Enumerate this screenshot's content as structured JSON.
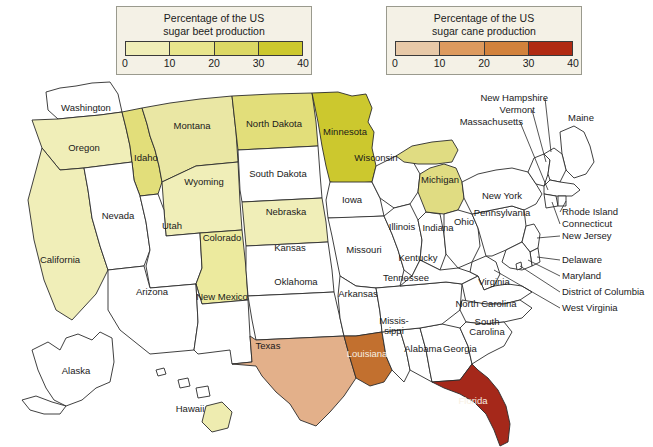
{
  "legends": [
    {
      "id": "beet",
      "title_line1": "Percentage of the US",
      "title_line2": "sugar beet production",
      "ticks": [
        "0",
        "10",
        "20",
        "30",
        "40"
      ],
      "colors": [
        "#f0eeb8",
        "#e8e58c",
        "#dcd865",
        "#ccc82e"
      ]
    },
    {
      "id": "cane",
      "title_line1": "Percentage of the US",
      "title_line2": "sugar cane production",
      "ticks": [
        "0",
        "10",
        "20",
        "30",
        "40"
      ],
      "colors": [
        "#e7c9a8",
        "#dd9a5e",
        "#d2823c",
        "#b02a12"
      ]
    }
  ],
  "map": {
    "background": "#ffffff",
    "unshaded_color": "#ffffff",
    "border_color": "#2b2b2b",
    "states": [
      {
        "name": "Washington",
        "label": "Washington",
        "fill": "#ffffff",
        "crop": "none",
        "bucket": null
      },
      {
        "name": "Oregon",
        "label": "Oregon",
        "fill": "#f0eeb8",
        "crop": "beet",
        "bucket": "0-10"
      },
      {
        "name": "Idaho",
        "label": "Idaho",
        "fill": "#e2de7a",
        "crop": "beet",
        "bucket": "20-30"
      },
      {
        "name": "Montana",
        "label": "Montana",
        "fill": "#eae7a4",
        "crop": "beet",
        "bucket": "10-20"
      },
      {
        "name": "North Dakota",
        "label": "North Dakota",
        "fill": "#e2de7a",
        "crop": "beet",
        "bucket": "20-30"
      },
      {
        "name": "Minnesota",
        "label": "Minnesota",
        "fill": "#ccc82e",
        "crop": "beet",
        "bucket": "30-40"
      },
      {
        "name": "South Dakota",
        "label": "South Dakota",
        "fill": "#ffffff",
        "crop": "none",
        "bucket": null
      },
      {
        "name": "Wisconsin",
        "label": "Wisconsin",
        "fill": "#ffffff",
        "crop": "none",
        "bucket": null
      },
      {
        "name": "Michigan",
        "label": "Michigan",
        "fill": "#e0dc82",
        "crop": "beet",
        "bucket": "10-20"
      },
      {
        "name": "Wyoming",
        "label": "Wyoming",
        "fill": "#f0eeb8",
        "crop": "beet",
        "bucket": "0-10"
      },
      {
        "name": "Nebraska",
        "label": "Nebraska",
        "fill": "#f0eeb8",
        "crop": "beet",
        "bucket": "0-10"
      },
      {
        "name": "Iowa",
        "label": "Iowa",
        "fill": "#ffffff",
        "crop": "none",
        "bucket": null
      },
      {
        "name": "Illinois",
        "label": "Illinois",
        "fill": "#ffffff",
        "crop": "none",
        "bucket": null
      },
      {
        "name": "Indiana",
        "label": "Indiana",
        "fill": "#ffffff",
        "crop": "none",
        "bucket": null
      },
      {
        "name": "Ohio",
        "label": "Ohio",
        "fill": "#ffffff",
        "crop": "none",
        "bucket": null
      },
      {
        "name": "Nevada",
        "label": "Nevada",
        "fill": "#ffffff",
        "crop": "none",
        "bucket": null
      },
      {
        "name": "Utah",
        "label": "Utah",
        "fill": "#ffffff",
        "crop": "none",
        "bucket": null
      },
      {
        "name": "Colorado",
        "label": "Colorado",
        "fill": "#ecea9e",
        "crop": "beet",
        "bucket": "10-20"
      },
      {
        "name": "California",
        "label": "California",
        "fill": "#f0eeb8",
        "crop": "beet",
        "bucket": "0-10"
      },
      {
        "name": "Arizona",
        "label": "Arizona",
        "fill": "#ffffff",
        "crop": "none",
        "bucket": null
      },
      {
        "name": "New Mexico",
        "label": "New Mexico",
        "fill": "#ffffff",
        "crop": "none",
        "bucket": null
      },
      {
        "name": "Kansas",
        "label": "Kansas",
        "fill": "#ffffff",
        "crop": "none",
        "bucket": null
      },
      {
        "name": "Missouri",
        "label": "Missouri",
        "fill": "#ffffff",
        "crop": "none",
        "bucket": null
      },
      {
        "name": "Oklahoma",
        "label": "Oklahoma",
        "fill": "#ffffff",
        "crop": "none",
        "bucket": null
      },
      {
        "name": "Arkansas",
        "label": "Arkansas",
        "fill": "#ffffff",
        "crop": "none",
        "bucket": null
      },
      {
        "name": "Texas",
        "label": "Texas",
        "fill": "#e3b08a",
        "crop": "cane",
        "bucket": "10-20"
      },
      {
        "name": "Louisiana",
        "label": "Louisiana",
        "fill": "#c2702f",
        "crop": "cane",
        "bucket": "20-30"
      },
      {
        "name": "Mississippi",
        "label": "Missis-sippi",
        "fill": "#ffffff",
        "crop": "none",
        "bucket": null
      },
      {
        "name": "Alabama",
        "label": "Alabama",
        "fill": "#ffffff",
        "crop": "none",
        "bucket": null
      },
      {
        "name": "Georgia",
        "label": "Georgia",
        "fill": "#ffffff",
        "crop": "none",
        "bucket": null
      },
      {
        "name": "Florida",
        "label": "Florida",
        "fill": "#a5281a",
        "crop": "cane",
        "bucket": "30-40"
      },
      {
        "name": "Tennessee",
        "label": "Tennessee",
        "fill": "#ffffff",
        "crop": "none",
        "bucket": null
      },
      {
        "name": "Kentucky",
        "label": "Kentucky",
        "fill": "#ffffff",
        "crop": "none",
        "bucket": null
      },
      {
        "name": "Virginia",
        "label": "Virginia",
        "fill": "#ffffff",
        "crop": "none",
        "bucket": null
      },
      {
        "name": "North Carolina",
        "label": "North Carolina",
        "fill": "#ffffff",
        "crop": "none",
        "bucket": null
      },
      {
        "name": "South Carolina",
        "label": "South Carolina",
        "fill": "#ffffff",
        "crop": "none",
        "bucket": null
      },
      {
        "name": "West Virginia",
        "label": "West Virginia",
        "fill": "#ffffff",
        "crop": "none",
        "bucket": null
      },
      {
        "name": "Pennsylvania",
        "label": "Pennsylvania",
        "fill": "#ffffff",
        "crop": "none",
        "bucket": null
      },
      {
        "name": "New York",
        "label": "New York",
        "fill": "#ffffff",
        "crop": "none",
        "bucket": null
      },
      {
        "name": "Maine",
        "label": "Maine",
        "fill": "#ffffff",
        "crop": "none",
        "bucket": null
      },
      {
        "name": "New Hampshire",
        "label": "New Hampshire",
        "fill": "#ffffff",
        "crop": "none",
        "bucket": null
      },
      {
        "name": "Vermont",
        "label": "Vermont",
        "fill": "#ffffff",
        "crop": "none",
        "bucket": null
      },
      {
        "name": "Massachusetts",
        "label": "Massachusetts",
        "fill": "#ffffff",
        "crop": "none",
        "bucket": null
      },
      {
        "name": "Rhode Island",
        "label": "Rhode Island",
        "fill": "#ffffff",
        "crop": "none",
        "bucket": null
      },
      {
        "name": "Connecticut",
        "label": "Connecticut",
        "fill": "#ffffff",
        "crop": "none",
        "bucket": null
      },
      {
        "name": "New Jersey",
        "label": "New Jersey",
        "fill": "#ffffff",
        "crop": "none",
        "bucket": null
      },
      {
        "name": "Delaware",
        "label": "Delaware",
        "fill": "#ffffff",
        "crop": "none",
        "bucket": null
      },
      {
        "name": "Maryland",
        "label": "Maryland",
        "fill": "#ffffff",
        "crop": "none",
        "bucket": null
      },
      {
        "name": "District of Columbia",
        "label": "District of Columbia",
        "fill": "#ffffff",
        "crop": "none",
        "bucket": null
      },
      {
        "name": "Alaska",
        "label": "Alaska",
        "fill": "#ffffff",
        "crop": "none",
        "bucket": null
      },
      {
        "name": "Hawaii",
        "label": "Hawaii",
        "fill": "#eeecb0",
        "crop": "beet",
        "bucket": "0-10"
      }
    ],
    "labels": {
      "washington": "Washington",
      "oregon": "Oregon",
      "idaho": "Idaho",
      "montana": "Montana",
      "north_dakota": "North Dakota",
      "minnesota": "Minnesota",
      "south_dakota": "South Dakota",
      "wisconsin": "Wisconsin",
      "michigan": "Michigan",
      "wyoming": "Wyoming",
      "nebraska": "Nebraska",
      "iowa": "Iowa",
      "illinois": "Illinois",
      "indiana": "Indiana",
      "ohio": "Ohio",
      "nevada": "Nevada",
      "utah": "Utah",
      "colorado": "Colorado",
      "california": "California",
      "arizona": "Arizona",
      "new_mexico": "New Mexico",
      "kansas": "Kansas",
      "missouri": "Missouri",
      "oklahoma": "Oklahoma",
      "arkansas": "Arkansas",
      "texas": "Texas",
      "louisiana": "Louisiana",
      "mississippi_1": "Missis-",
      "mississippi_2": "sippi",
      "alabama": "Alabama",
      "georgia": "Georgia",
      "florida": "Florida",
      "tennessee": "Tennessee",
      "kentucky": "Kentucky",
      "virginia": "Virginia",
      "north_carolina": "North Carolina",
      "south_carolina_1": "South",
      "south_carolina_2": "Carolina",
      "west_virginia": "West Virginia",
      "pennsylvania": "Pennsylvania",
      "new_york": "New York",
      "maine": "Maine",
      "new_hampshire": "New Hampshire",
      "vermont": "Vermont",
      "massachusetts": "Massachusetts",
      "rhode_island": "Rhode Island",
      "connecticut": "Connecticut",
      "new_jersey": "New Jersey",
      "delaware": "Delaware",
      "maryland": "Maryland",
      "district_of_columbia": "District of Columbia",
      "alaska": "Alaska",
      "hawaii": "Hawaii"
    }
  }
}
